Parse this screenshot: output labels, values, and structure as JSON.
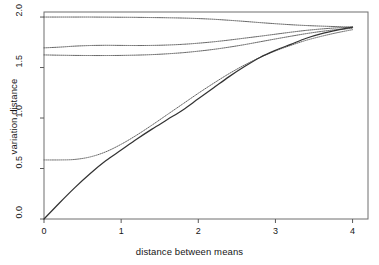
{
  "chart_data": {
    "type": "line",
    "title": "",
    "subtitle": "",
    "xlabel": "distance between means",
    "ylabel": "variation distance",
    "xlim": [
      0,
      4.2
    ],
    "ylim": [
      0,
      2.05
    ],
    "xticks": [
      0,
      1,
      2,
      3,
      4
    ],
    "xtick_labels": [
      "0",
      "1",
      "2",
      "3",
      "4"
    ],
    "yticks": [
      0.0,
      0.5,
      1.0,
      1.5,
      2.0
    ],
    "ytick_labels": [
      "0.0",
      "0.5",
      "1.0",
      "1.5",
      "2.0"
    ],
    "grid": false,
    "legend": "none",
    "frame": "box",
    "series": [
      {
        "name": "upper bound 1",
        "style": "dotted",
        "color": "#555555",
        "x": [
          0,
          0.2,
          0.4,
          0.6,
          0.8,
          1.0,
          1.2,
          1.4,
          1.6,
          1.8,
          2.0,
          2.2,
          2.4,
          2.6,
          2.8,
          3.0,
          3.2,
          3.4,
          3.6,
          3.8,
          4.0
        ],
        "values": [
          2.0,
          2.0,
          2.0,
          2.0,
          1.999,
          1.998,
          1.997,
          1.995,
          1.993,
          1.99,
          1.985,
          1.978,
          1.968,
          1.957,
          1.945,
          1.934,
          1.924,
          1.916,
          1.91,
          1.905,
          1.9
        ]
      },
      {
        "name": "upper bound 2",
        "style": "dotted",
        "color": "#555555",
        "x": [
          0,
          0.2,
          0.4,
          0.6,
          0.8,
          1.0,
          1.2,
          1.4,
          1.6,
          1.8,
          2.0,
          2.2,
          2.4,
          2.6,
          2.8,
          3.0,
          3.2,
          3.4,
          3.6,
          3.8,
          4.0
        ],
        "values": [
          1.695,
          1.702,
          1.712,
          1.718,
          1.72,
          1.719,
          1.718,
          1.719,
          1.723,
          1.73,
          1.741,
          1.755,
          1.772,
          1.791,
          1.81,
          1.83,
          1.85,
          1.868,
          1.882,
          1.893,
          1.9
        ]
      },
      {
        "name": "upper bound 3",
        "style": "dotted",
        "color": "#555555",
        "x": [
          0,
          0.2,
          0.4,
          0.6,
          0.8,
          1.0,
          1.2,
          1.4,
          1.6,
          1.8,
          2.0,
          2.2,
          2.4,
          2.6,
          2.8,
          3.0,
          3.2,
          3.4,
          3.6,
          3.8,
          4.0
        ],
        "values": [
          1.625,
          1.622,
          1.62,
          1.619,
          1.619,
          1.62,
          1.623,
          1.628,
          1.636,
          1.647,
          1.662,
          1.68,
          1.702,
          1.727,
          1.755,
          1.783,
          1.81,
          1.836,
          1.858,
          1.876,
          1.888
        ]
      },
      {
        "name": "lower bound",
        "style": "dotted",
        "color": "#666666",
        "x": [
          0,
          0.2,
          0.4,
          0.6,
          0.8,
          1.0,
          1.2,
          1.4,
          1.6,
          1.8,
          2.0,
          2.2,
          2.4,
          2.6,
          2.8,
          3.0,
          3.2,
          3.4,
          3.6,
          3.8,
          4.0
        ],
        "values": [
          0.585,
          0.585,
          0.59,
          0.615,
          0.665,
          0.74,
          0.83,
          0.93,
          1.035,
          1.14,
          1.245,
          1.345,
          1.44,
          1.525,
          1.6,
          1.665,
          1.72,
          1.77,
          1.81,
          1.845,
          1.875
        ]
      },
      {
        "name": "variation distance",
        "style": "solid",
        "color": "#333333",
        "x": [
          0,
          0.2,
          0.4,
          0.6,
          0.8,
          1.0,
          1.2,
          1.4,
          1.6,
          1.8,
          2.0,
          2.2,
          2.4,
          2.6,
          2.8,
          3.0,
          3.2,
          3.4,
          3.6,
          3.8,
          4.0
        ],
        "values": [
          0.0,
          0.159,
          0.311,
          0.451,
          0.576,
          0.683,
          0.79,
          0.89,
          0.985,
          1.08,
          1.19,
          1.3,
          1.41,
          1.51,
          1.6,
          1.67,
          1.73,
          1.79,
          1.835,
          1.87,
          1.9
        ]
      }
    ]
  }
}
